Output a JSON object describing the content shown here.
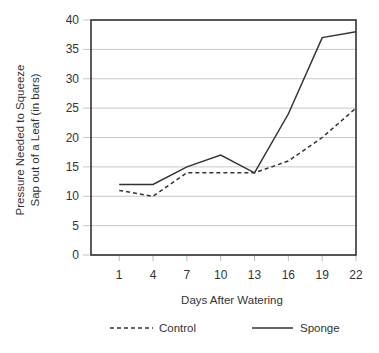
{
  "chart_data": {
    "type": "line",
    "title": "",
    "xlabel": "Days After Watering",
    "ylabel_line1": "Pressure Needed to Squeeze",
    "ylabel_line2": "Sap out of a Leaf (in bars)",
    "ylabel": "Pressure Needed to Squeeze Sap out of a Leaf (in bars)",
    "x": [
      1,
      4,
      7,
      10,
      13,
      16,
      19,
      22
    ],
    "x_tick_labels": [
      "1",
      "4",
      "7",
      "10",
      "13",
      "16",
      "19",
      "22"
    ],
    "y_ticks": [
      0,
      5,
      10,
      15,
      20,
      25,
      30,
      35,
      40
    ],
    "y_tick_labels": [
      "0",
      "5",
      "10",
      "15",
      "20",
      "25",
      "30",
      "35",
      "40"
    ],
    "ylim": [
      0,
      40
    ],
    "grid": "horizontal",
    "legend_position": "bottom",
    "series": [
      {
        "name": "Control",
        "style": "dashed",
        "values": [
          11,
          10,
          14,
          14,
          14,
          16,
          20,
          25
        ]
      },
      {
        "name": "Sponge",
        "style": "solid",
        "values": [
          12,
          12,
          15,
          17,
          14,
          24,
          37,
          38
        ]
      }
    ]
  },
  "legend": {
    "control_label": "Control",
    "sponge_label": "Sponge"
  },
  "colors": {
    "line": "#333333",
    "grid": "#c8c8c8",
    "frame": "#333333"
  }
}
